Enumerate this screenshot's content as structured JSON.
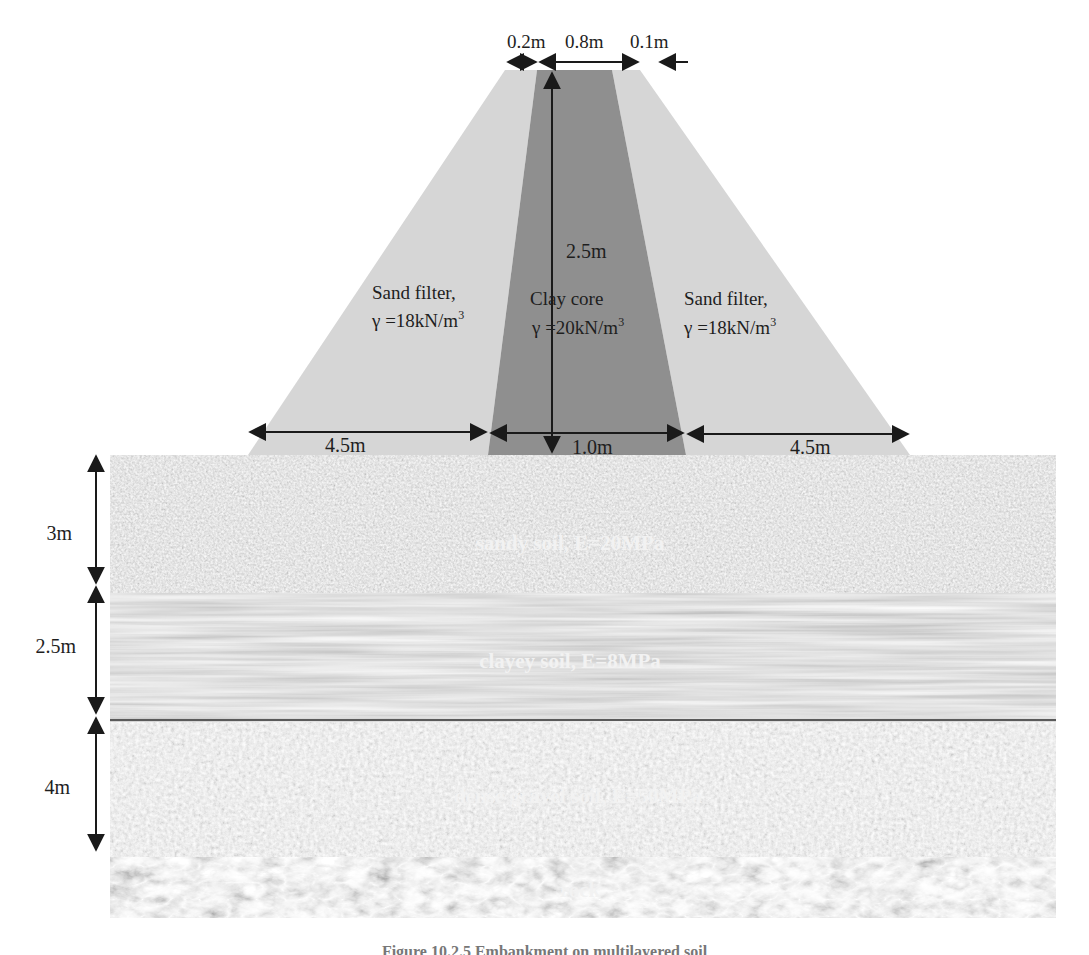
{
  "dam": {
    "top_dims": {
      "left": "0.2m",
      "center": "0.8m",
      "right": "0.1m"
    },
    "height": "2.5m",
    "base_dims": {
      "left": "4.5m",
      "center": "1.0m",
      "right": "4.5m"
    },
    "sand_filter_left": {
      "name": "Sand filter,",
      "unit_weight": "γ =18kN/m",
      "exp": "3"
    },
    "clay_core": {
      "name": "Clay core",
      "unit_weight": "γ =20kN/m",
      "exp": "3"
    },
    "sand_filter_right": {
      "name": "Sand filter,",
      "unit_weight": "γ =18kN/m",
      "exp": "3"
    },
    "colors": {
      "sand_filter": "#d6d6d6",
      "clay_core": "#8e8e8e"
    }
  },
  "layers": [
    {
      "label": "sandy soil, E=20MPa",
      "thickness": "3m",
      "color": "#8a8a8a"
    },
    {
      "label": "clayey soil, E=8MPa",
      "thickness": "2.5m",
      "color": "#838383"
    },
    {
      "label": "dense gravel soil, E=50MPa",
      "thickness": "4m",
      "color": "#a2a2a2"
    },
    {
      "label": "rock",
      "thickness": "",
      "color": "#767676"
    }
  ],
  "caption": "Figure 10.2.5 Embankment on multilayered soil"
}
